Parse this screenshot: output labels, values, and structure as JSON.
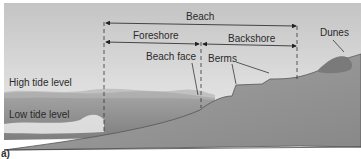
{
  "figure": {
    "panel_label": "a)",
    "labels": {
      "beach": "Beach",
      "foreshore": "Foreshore",
      "backshore": "Backshore",
      "dunes": "Dunes",
      "beach_face": "Beach face",
      "berms": "Berms",
      "high_tide": "High tide level",
      "low_tide": "Low tide level"
    },
    "colors": {
      "sky_top": "#c9c9c9",
      "sky_bottom": "#e2e2e2",
      "water": "#8c8c8c",
      "land": "#9a9a9a",
      "land_dark": "#7c7c7c",
      "line": "#222222"
    }
  }
}
